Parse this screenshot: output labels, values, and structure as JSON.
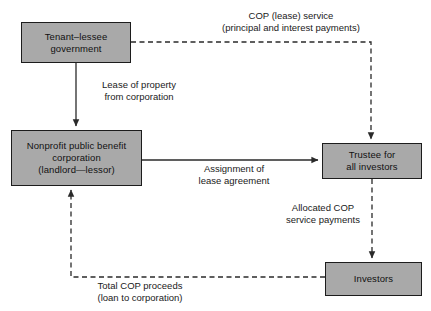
{
  "diagram": {
    "type": "flow-diagram",
    "title": "",
    "colors": {
      "box_fill": "#a9a9a9",
      "box_border": "#1c1c1c",
      "line": "#2a2a2a",
      "background": "#ffffff",
      "text": "#111111"
    },
    "nodes": [
      {
        "id": "tenant",
        "label": "Tenant–lessee\ngovernment",
        "lines": [
          "Tenant–lessee",
          "government"
        ]
      },
      {
        "id": "nonprofit",
        "label": "Nonprofit public benefit\ncorporation\n(landlord—lessor)",
        "lines": [
          "Nonprofit public benefit",
          "corporation",
          "(landlord—lessor)"
        ]
      },
      {
        "id": "trustee",
        "label": "Trustee for\nall investors",
        "lines": [
          "Trustee for",
          "all investors"
        ]
      },
      {
        "id": "investors",
        "label": "Investors",
        "lines": [
          "Investors"
        ]
      }
    ],
    "edges": [
      {
        "id": "cop-service",
        "from": "tenant",
        "to": "trustee",
        "style": "dashed",
        "label": "COP (lease) service\n(principal and interest payments)",
        "lines": [
          "COP (lease) service",
          "(principal and interest payments)"
        ]
      },
      {
        "id": "lease-property",
        "from": "tenant",
        "to": "nonprofit",
        "style": "solid",
        "label": "Lease of property\nfrom corporation",
        "lines": [
          "Lease of property",
          "from corporation"
        ]
      },
      {
        "id": "assignment",
        "from": "nonprofit",
        "to": "trustee",
        "style": "solid",
        "label": "Assignment of\nlease agreement",
        "lines": [
          "Assignment of",
          "lease agreement"
        ]
      },
      {
        "id": "allocated",
        "from": "trustee",
        "to": "investors",
        "style": "dashed",
        "label": "Allocated COP\nservice payments",
        "lines": [
          "Allocated COP",
          "service payments"
        ]
      },
      {
        "id": "total-proceeds",
        "from": "investors",
        "to": "nonprofit",
        "style": "dashed",
        "label": "Total COP proceeds\n(loan to corporation)",
        "lines": [
          "Total COP proceeds",
          "(loan to corporation)"
        ]
      }
    ]
  }
}
